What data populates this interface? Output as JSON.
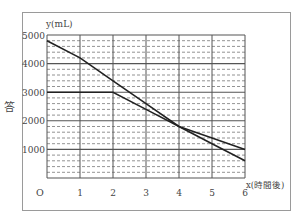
{
  "side_label": "答",
  "chart_data": {
    "type": "line",
    "title": "",
    "xlabel": "x(時間後)",
    "ylabel": "y(mL)",
    "origin_label": "O",
    "xlim": [
      0,
      6
    ],
    "ylim": [
      0,
      5000
    ],
    "x_ticks": [
      1,
      2,
      3,
      4,
      5,
      6
    ],
    "y_ticks": [
      1000,
      2000,
      3000,
      4000,
      5000
    ],
    "grid": {
      "major_solid_every": 1000,
      "minor_dashed_every": 200,
      "vertical_every": 1
    },
    "legend": null,
    "series": [
      {
        "name": "line-a",
        "x": [
          0,
          1,
          2,
          3,
          4,
          5,
          6
        ],
        "values": [
          4800,
          4200,
          3400,
          2600,
          1800,
          1200,
          600
        ]
      },
      {
        "name": "line-b",
        "x": [
          0,
          1,
          2,
          3,
          4,
          5,
          6
        ],
        "values": [
          3000,
          3000,
          3000,
          2400,
          1800,
          1400,
          1000
        ]
      }
    ],
    "colors": {
      "line": "#222222",
      "grid_major": "#555555",
      "grid_minor": "#777777",
      "frame": "#999999"
    }
  }
}
